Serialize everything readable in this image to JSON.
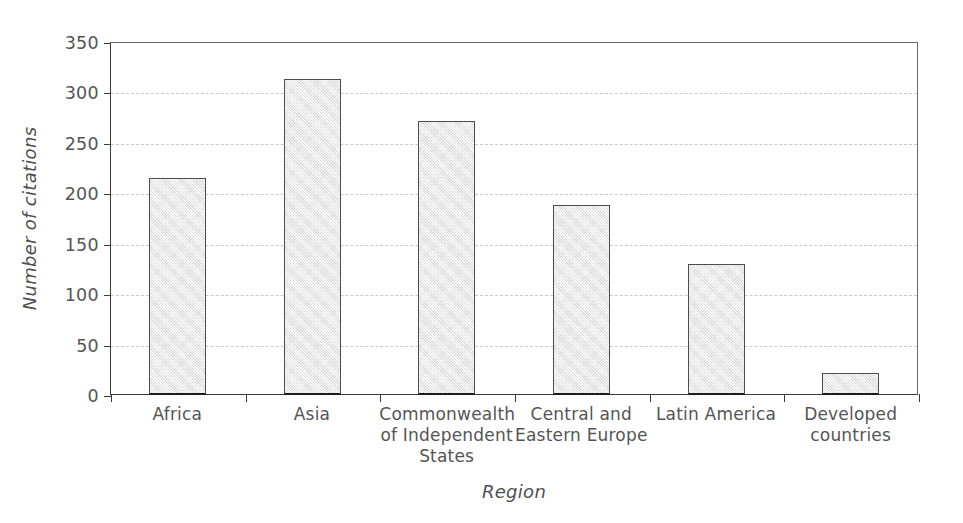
{
  "chart_data": {
    "type": "bar",
    "title": "",
    "categories": [
      "Africa",
      "Asia",
      "Commonwealth of Independent States",
      "Central and Eastern Europe",
      "Latin America",
      "Developed countries"
    ],
    "category_label_lines": [
      [
        "Africa"
      ],
      [
        "Asia"
      ],
      [
        "Commonwealth",
        "of Independent",
        "States"
      ],
      [
        "Central and",
        "Eastern Europe"
      ],
      [
        "Latin America"
      ],
      [
        "Developed",
        "countries"
      ]
    ],
    "values": [
      215,
      313,
      272,
      188,
      130,
      22
    ],
    "xlabel": "Region",
    "ylabel": "Number of citations",
    "ylim": [
      0,
      350
    ],
    "ytick_values": [
      0,
      50,
      100,
      150,
      200,
      250,
      300,
      350
    ],
    "ytick_labels": [
      "0",
      "50",
      "100",
      "150",
      "200",
      "250",
      "300",
      "350"
    ],
    "grid": true,
    "grid_axis": "y",
    "grid_style": "dashed",
    "legend": false,
    "legend_position": "none",
    "bar_fill_color": "#e9e9e9",
    "bar_edge_color": "#4d4d4d",
    "axis_color": "#3a3a3a",
    "grid_color": "#c9c9c9",
    "text_color": "#555555"
  }
}
